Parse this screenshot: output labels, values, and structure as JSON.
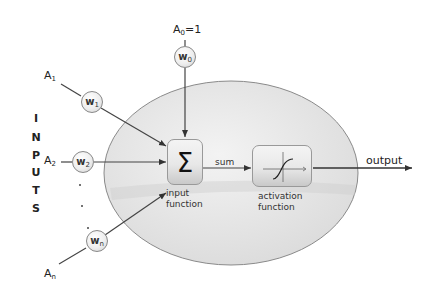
{
  "diagram": {
    "type": "artificial-neuron",
    "side_label": [
      "I",
      "N",
      "P",
      "U",
      "T",
      "S"
    ],
    "bias": {
      "input_label": "A",
      "input_sub": "0",
      "input_value": "=1",
      "weight_label": "w",
      "weight_sub": "0"
    },
    "inputs": [
      {
        "label": "A",
        "sub": "1",
        "weight_label": "w",
        "weight_sub": "1"
      },
      {
        "label": "A",
        "sub": "2",
        "weight_label": "w",
        "weight_sub": "2"
      },
      {
        "label": "A",
        "sub": "n",
        "weight_label": "w",
        "weight_sub": "n"
      }
    ],
    "ellipsis": "...",
    "input_function": {
      "symbol": "Σ",
      "label_line1": "input",
      "label_line2": "function"
    },
    "sum_label": "sum",
    "activation_function": {
      "label_line1": "activation",
      "label_line2": "function",
      "icon": "sigmoid-curve"
    },
    "output_label": "output",
    "colors": {
      "ellipse_fill": "#e6e6e6",
      "ellipse_stroke": "#8a8a8a",
      "line": "#444444"
    }
  }
}
